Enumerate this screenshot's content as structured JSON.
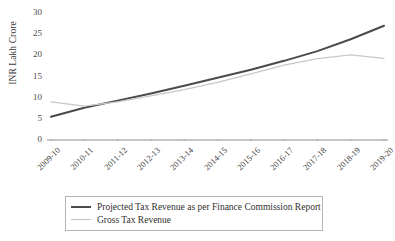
{
  "chart_data": {
    "type": "line",
    "title": "",
    "xlabel": "",
    "ylabel": "INR Lakh Crore",
    "ylim": [
      0,
      30
    ],
    "yticks": [
      0,
      5,
      10,
      15,
      20,
      25,
      30
    ],
    "ytick_labels": [
      "0",
      "5",
      "10",
      "15",
      "20",
      "25",
      "30"
    ],
    "grid": false,
    "legend_position": "bottom",
    "categories": [
      "2009-10",
      "2010-11",
      "2011-12",
      "2012-13",
      "2013-14",
      "2014-15",
      "2015-16",
      "2016-17",
      "2017-18",
      "2018-19",
      "2019-20"
    ],
    "series": [
      {
        "name": "Projected Tax Revenue as per Finance Commission Report",
        "color": "#4a4a4a",
        "width": 2.0,
        "values": [
          5.5,
          7.6,
          9.3,
          11.0,
          12.8,
          14.7,
          16.6,
          18.7,
          21.0,
          23.8,
          27.0
        ]
      },
      {
        "name": "Gross Tax Revenue",
        "color": "#c8c8c8",
        "width": 1.3,
        "values": [
          9.0,
          8.0,
          9.0,
          10.4,
          11.9,
          13.6,
          15.6,
          17.7,
          19.2,
          20.1,
          19.3
        ]
      }
    ]
  },
  "legend": {
    "items": [
      {
        "label": "Projected Tax Revenue as per Finance Commission Report"
      },
      {
        "label": "Gross Tax Revenue"
      }
    ]
  }
}
